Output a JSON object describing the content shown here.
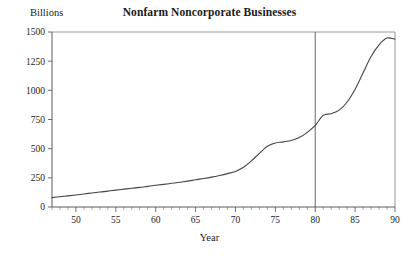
{
  "chart_data": {
    "type": "line",
    "title": "Nonfarm Noncorporate Businesses",
    "ylabel": "Billions",
    "xlabel": "Year",
    "xlim": [
      47,
      90
    ],
    "ylim": [
      0,
      1500
    ],
    "xticks": [
      50,
      55,
      60,
      65,
      70,
      75,
      80,
      85,
      90
    ],
    "xtick_labels": [
      "50",
      "55",
      "60",
      "65",
      "70",
      "75",
      "80",
      "85",
      "90"
    ],
    "yticks": [
      0,
      250,
      500,
      750,
      1000,
      1250,
      1500
    ],
    "ytick_labels": [
      "0",
      "250",
      "500",
      "750",
      "1000",
      "1250",
      "1500"
    ],
    "minor_xtick_step": 1,
    "grid": false,
    "legend": false,
    "annotations": [
      {
        "type": "vertical-line",
        "x": 80,
        "label": "1980 reference line"
      }
    ],
    "series": [
      {
        "name": "Nonfarm Noncorporate Businesses",
        "color": "#444444",
        "x": [
          47,
          48,
          49,
          50,
          51,
          52,
          53,
          54,
          55,
          56,
          57,
          58,
          59,
          60,
          61,
          62,
          63,
          64,
          65,
          66,
          67,
          68,
          69,
          70,
          71,
          72,
          73,
          74,
          75,
          76,
          77,
          78,
          79,
          80,
          81,
          82,
          83,
          84,
          85,
          86,
          87,
          88,
          89,
          90
        ],
        "values": [
          80,
          88,
          95,
          103,
          112,
          120,
          128,
          136,
          145,
          153,
          161,
          168,
          177,
          186,
          194,
          203,
          212,
          222,
          233,
          244,
          256,
          270,
          286,
          305,
          340,
          395,
          460,
          520,
          548,
          558,
          570,
          595,
          640,
          700,
          785,
          800,
          830,
          900,
          1010,
          1150,
          1290,
          1390,
          1448,
          1438
        ]
      }
    ]
  },
  "figure": {
    "background": "#ffffff",
    "axis_color": "#4a4a4a",
    "line_color": "#444444"
  }
}
